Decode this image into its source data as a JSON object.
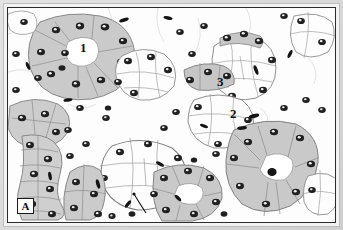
{
  "figure": {
    "panel_letter": "A",
    "width": 343,
    "height": 230,
    "modality": "light-micrograph-illustration"
  },
  "colors": {
    "page_background": "#ffffff",
    "frame_outer": "#dedede",
    "frame_inner": "#f2f2f2",
    "micrograph_background": "#fdfdfd",
    "border_line": "#2b2b2b",
    "serous_acinus_fill": "#cccccc",
    "serous_acinus_fill_light": "#d8d8d8",
    "mucous_acinus_fill": "#fcfcfc",
    "duct_fill": "#d0d0d0",
    "cell_outline": "#8a8a8a",
    "nucleus_fill": "#1d1d1d",
    "nucleus_ring": "#ffffff",
    "label_text": "#111111"
  },
  "labels": [
    {
      "id": "label-1",
      "text": "1",
      "x": 72,
      "y": 33,
      "note": "serous acinus with central lumen"
    },
    {
      "id": "label-3",
      "text": "3",
      "x": 209,
      "y": 67,
      "note": "serous demilune"
    },
    {
      "id": "label-2",
      "text": "2",
      "x": 222,
      "y": 99,
      "note": "mucous acinus"
    },
    {
      "id": "label-4",
      "text": "4",
      "x": 138,
      "y": 211,
      "note": "intercalated duct, leader line"
    }
  ],
  "leader_lines": [
    {
      "id": "leader-4",
      "x1": 142,
      "y1": 208,
      "x2": 131,
      "y2": 190
    }
  ],
  "structures": {
    "serous_acini": 7,
    "mucous_acini": 8,
    "ducts": 2,
    "serous_demilunes": 2,
    "interstitial_nuclei": 46
  }
}
